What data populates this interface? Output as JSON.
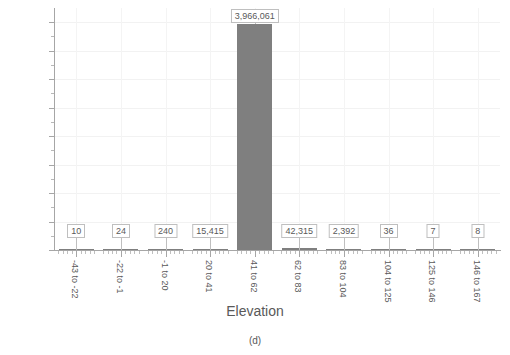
{
  "chart_data": {
    "type": "bar",
    "title": "",
    "subtitle": "",
    "xlabel": "Elevation",
    "ylabel": "",
    "caption": "(d)",
    "categories": [
      "-43 to -22",
      "-22 to -1",
      "-1 to 20",
      "20 to 41",
      "41 to 62",
      "62 to 83",
      "83 to 104",
      "104 to 125",
      "125 to 146",
      "146 to 167"
    ],
    "values": [
      10,
      24,
      240,
      15415,
      3966061,
      42315,
      2392,
      36,
      7,
      8
    ],
    "data_labels": [
      "10",
      "24",
      "240",
      "15,415",
      "3,966,061",
      "42,315",
      "2,392",
      "36",
      "7",
      "8"
    ],
    "ylim": [
      0,
      4250000
    ],
    "ytick_values": [
      0,
      500000,
      1000000,
      1500000,
      2000000,
      2500000,
      3000000,
      3500000,
      4000000
    ],
    "ytick_labels": [
      "0",
      "500,000",
      "1,000,000",
      "1,500,000",
      "2,000,000",
      "2,500,000",
      "3,000,000",
      "3,500,000",
      "4,000,000"
    ],
    "grid": true,
    "legend": false,
    "bar_color": "#7f7f7f",
    "axis_color": "#a6a6a6",
    "grid_color": "#f2f2f2",
    "text_color": "#595959"
  }
}
